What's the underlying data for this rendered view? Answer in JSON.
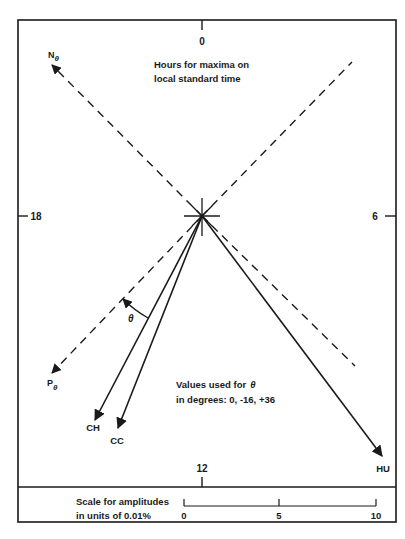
{
  "dial": {
    "hour_labels": {
      "top": "0",
      "right": "6",
      "bottom": "12",
      "left": "18"
    },
    "title_line1": "Hours for maxima on",
    "title_line2": "local standard time"
  },
  "axes": {
    "n_label": "N",
    "p_label": "P",
    "subscript": "θ"
  },
  "vectors": [
    {
      "name": "CH",
      "tip": [
        95,
        420
      ]
    },
    {
      "name": "CC",
      "tip": [
        118,
        428
      ]
    },
    {
      "name": "HU",
      "tip": [
        382,
        456
      ]
    }
  ],
  "theta": {
    "symbol": "θ",
    "note_line1": "Values used for",
    "note_symbol": "θ",
    "note_line2": "in degrees:  0, -16, +36"
  },
  "scale": {
    "label_line1": "Scale for amplitudes",
    "label_line2": "in units of 0.01%",
    "ticks": [
      "0",
      "5",
      "10"
    ]
  },
  "colors": {
    "ink": "#1a1a1a",
    "background": "#ffffff"
  }
}
